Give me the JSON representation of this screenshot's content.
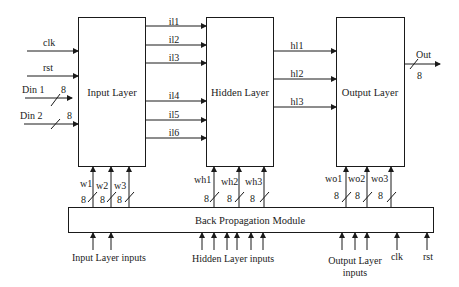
{
  "blocks": {
    "input_layer": "Input Layer",
    "hidden_layer": "Hidden Layer",
    "output_layer": "Output Layer",
    "backprop": "Back Propagation Module"
  },
  "input_signals": {
    "clk": "clk",
    "rst": "rst",
    "din1": "Din 1",
    "din2": "Din 2",
    "din1_width": "8",
    "din2_width": "8"
  },
  "input_to_hidden": [
    "il1",
    "il2",
    "il3",
    "il4",
    "il5",
    "il6"
  ],
  "hidden_to_output": [
    "hl1",
    "hl2",
    "hl3"
  ],
  "output": {
    "label": "Out",
    "width": "8"
  },
  "weights": {
    "input": [
      "w1",
      "w2",
      "w3"
    ],
    "hidden": [
      "wh1",
      "wh2",
      "wh3"
    ],
    "output": [
      "wo1",
      "wo2",
      "wo3"
    ],
    "width": "8"
  },
  "bp_inputs": {
    "input_layer": "Input Layer inputs",
    "hidden_layer": "Hidden Layer inputs",
    "output_layer_line1": "Output Layer",
    "output_layer_line2": "inputs",
    "clk": "clk",
    "rst": "rst"
  }
}
